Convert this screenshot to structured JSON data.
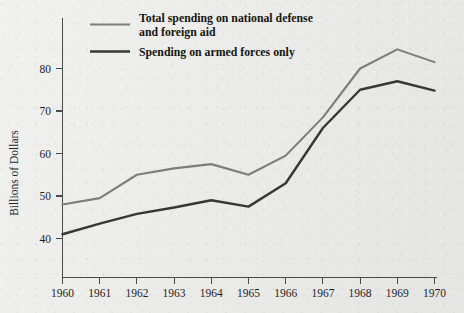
{
  "chart_data": {
    "type": "line",
    "title": "",
    "xlabel": "",
    "ylabel": "Billions of Dollars",
    "x": [
      1960,
      1961,
      1962,
      1963,
      1964,
      1965,
      1966,
      1967,
      1968,
      1969,
      1970
    ],
    "categories": [
      "1960",
      "1961",
      "1962",
      "1963",
      "1964",
      "1965",
      "1966",
      "1967",
      "1968",
      "1969",
      "1970"
    ],
    "series": [
      {
        "name": "Total spending on national defense and foreign aid",
        "color": "#7d7d7d",
        "values": [
          48.0,
          49.5,
          55.0,
          56.5,
          57.5,
          55.0,
          59.5,
          68.5,
          80.0,
          84.5,
          81.5
        ]
      },
      {
        "name": "Spending on armed forces only",
        "color": "#373737",
        "values": [
          41.0,
          43.5,
          45.8,
          47.3,
          49.0,
          47.5,
          53.0,
          66.0,
          75.0,
          77.0,
          74.8
        ]
      }
    ],
    "ylim": [
      34,
      88
    ],
    "xlim": [
      1960,
      1970
    ],
    "yticks": [
      40,
      50,
      60,
      70,
      80
    ],
    "ytick_labels": [
      "40",
      "50",
      "60",
      "70",
      "80"
    ],
    "xticks": [
      1960,
      1961,
      1962,
      1963,
      1964,
      1965,
      1966,
      1967,
      1968,
      1969,
      1970
    ],
    "grid": false,
    "legend_position": "top-left-inside"
  },
  "legend": {
    "entries": [
      {
        "label_line1": "Total spending on national defense",
        "label_line2": "and foreign aid",
        "color": "#7d7d7d"
      },
      {
        "label_line1": "Spending on armed forces only",
        "label_line2": "",
        "color": "#373737"
      }
    ]
  },
  "axes": {
    "y_title": "Billions of Dollars",
    "y_labels": [
      "80",
      "70",
      "60",
      "50",
      "40"
    ],
    "x_labels": [
      "1960",
      "1961",
      "1962",
      "1963",
      "1964",
      "1965",
      "1966",
      "1967",
      "1968",
      "1969",
      "1970"
    ]
  },
  "colors": {
    "background": "#e9e9e7",
    "axis": "#4a4a4a",
    "text": "#1e1e1e",
    "series_total": "#7d7d7d",
    "series_armed": "#373737"
  }
}
